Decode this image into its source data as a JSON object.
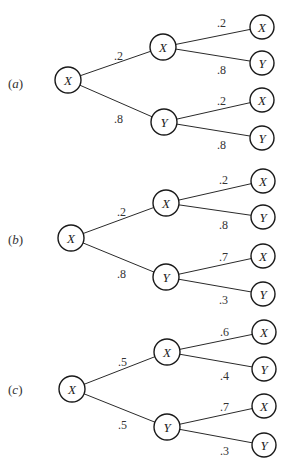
{
  "diagram": {
    "background": "#ffffff",
    "line_color": "#2a2a2a",
    "trees": [
      {
        "id": "a",
        "label_open": "(",
        "label_letter": "a",
        "label_close": ")",
        "label_pos": [
          8,
          88
        ],
        "root": {
          "label": "X",
          "cx": 68,
          "cy": 80
        },
        "upper": {
          "label": "X",
          "cx": 163,
          "cy": 47,
          "edge_prob": ".2",
          "edge_prob_pos": [
            114,
            60
          ],
          "children": [
            {
              "label": "X",
              "cx": 262,
              "cy": 27,
              "prob": ".2",
              "prob_pos": [
                217,
                27
              ]
            },
            {
              "label": "Y",
              "cx": 262,
              "cy": 63,
              "prob": ".8",
              "prob_pos": [
                217,
                74
              ]
            }
          ]
        },
        "lower": {
          "label": "Y",
          "cx": 164,
          "cy": 122,
          "edge_prob": ".8",
          "edge_prob_pos": [
            114,
            123
          ],
          "children": [
            {
              "label": "X",
              "cx": 262,
              "cy": 100,
              "prob": ".2",
              "prob_pos": [
                217,
                105
              ]
            },
            {
              "label": "Y",
              "cx": 262,
              "cy": 138,
              "prob": ".8",
              "prob_pos": [
                217,
                149
              ]
            }
          ]
        }
      },
      {
        "id": "b",
        "label_open": "(",
        "label_letter": "b",
        "label_close": ")",
        "label_pos": [
          8,
          244
        ],
        "root": {
          "label": "X",
          "cx": 71,
          "cy": 238
        },
        "upper": {
          "label": "X",
          "cx": 166,
          "cy": 203,
          "edge_prob": ".2",
          "edge_prob_pos": [
            117,
            216
          ],
          "children": [
            {
              "label": "X",
              "cx": 263,
              "cy": 181,
              "prob": ".2",
              "prob_pos": [
                219,
                184
              ]
            },
            {
              "label": "Y",
              "cx": 263,
              "cy": 217,
              "prob": ".8",
              "prob_pos": [
                219,
                229
              ]
            }
          ]
        },
        "lower": {
          "label": "Y",
          "cx": 166,
          "cy": 277,
          "edge_prob": ".8",
          "edge_prob_pos": [
            117,
            278
          ],
          "children": [
            {
              "label": "X",
              "cx": 263,
              "cy": 256,
              "prob": ".7",
              "prob_pos": [
                219,
                261
              ]
            },
            {
              "label": "Y",
              "cx": 263,
              "cy": 294,
              "prob": ".3",
              "prob_pos": [
                219,
                304
              ]
            }
          ]
        }
      },
      {
        "id": "c",
        "label_open": "(",
        "label_letter": "c",
        "label_close": ")",
        "label_pos": [
          8,
          394
        ],
        "root": {
          "label": "X",
          "cx": 72,
          "cy": 389
        },
        "upper": {
          "label": "X",
          "cx": 167,
          "cy": 352,
          "edge_prob": ".5",
          "edge_prob_pos": [
            118,
            366
          ],
          "children": [
            {
              "label": "X",
              "cx": 264,
              "cy": 332,
              "prob": ".6",
              "prob_pos": [
                220,
                336
              ]
            },
            {
              "label": "Y",
              "cx": 264,
              "cy": 369,
              "prob": ".4",
              "prob_pos": [
                220,
                380
              ]
            }
          ]
        },
        "lower": {
          "label": "Y",
          "cx": 167,
          "cy": 427,
          "edge_prob": ".5",
          "edge_prob_pos": [
            118,
            429
          ],
          "children": [
            {
              "label": "X",
              "cx": 264,
              "cy": 406,
              "prob": ".7",
              "prob_pos": [
                220,
                411
              ]
            },
            {
              "label": "Y",
              "cx": 264,
              "cy": 445,
              "prob": ".3",
              "prob_pos": [
                220,
                455
              ]
            }
          ]
        }
      }
    ]
  }
}
